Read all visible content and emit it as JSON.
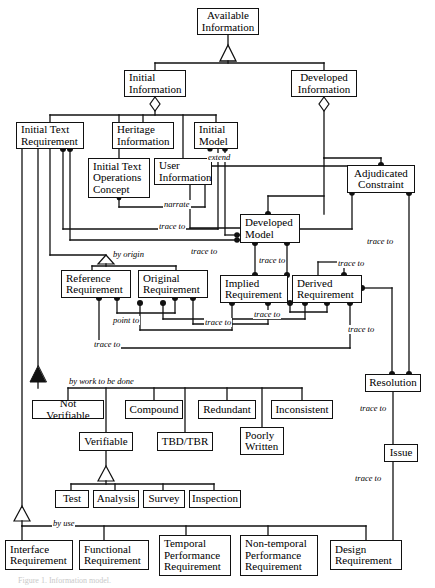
{
  "diagram": {
    "type": "uml-class-diagram",
    "colors": {
      "line": "#111111",
      "fill": "#ffffff",
      "text": "#000000"
    },
    "caption": "Figure 1. Information model.",
    "nodes": [
      {
        "id": "available-information",
        "label": "Available\nInformation",
        "x": 197,
        "y": 8,
        "w": 62,
        "h": 27,
        "align": "center"
      },
      {
        "id": "initial-information",
        "label": "Initial\nInformation",
        "x": 124,
        "y": 70,
        "w": 62,
        "h": 27,
        "align": "left"
      },
      {
        "id": "developed-information",
        "label": "Developed\nInformation",
        "x": 291,
        "y": 70,
        "w": 66,
        "h": 27,
        "align": "center"
      },
      {
        "id": "initial-text-requirement",
        "label": "Initial Text\nRequirement",
        "x": 16,
        "y": 122,
        "w": 68,
        "h": 27,
        "align": "left"
      },
      {
        "id": "heritage-information",
        "label": "Heritage\nInformation",
        "x": 112,
        "y": 122,
        "w": 62,
        "h": 27,
        "align": "left"
      },
      {
        "id": "initial-model",
        "label": "Initial\nModel",
        "x": 194,
        "y": 122,
        "w": 44,
        "h": 27,
        "align": "left"
      },
      {
        "id": "initial-text-ops-concept",
        "label": "Initial Text\nOperations\nConcept",
        "x": 88,
        "y": 158,
        "w": 62,
        "h": 40,
        "align": "left"
      },
      {
        "id": "user-information",
        "label": "User\nInformation",
        "x": 154,
        "y": 158,
        "w": 58,
        "h": 27,
        "align": "left"
      },
      {
        "id": "developed-model",
        "label": "Developed\nModel",
        "x": 240,
        "y": 214,
        "w": 60,
        "h": 29,
        "align": "left"
      },
      {
        "id": "adjudicated-constraint",
        "label": "Adjudicated\nConstraint",
        "x": 347,
        "y": 165,
        "w": 68,
        "h": 28,
        "align": "center"
      },
      {
        "id": "reference-requirement",
        "label": "Reference\nRequirement",
        "x": 61,
        "y": 270,
        "w": 70,
        "h": 28,
        "align": "left"
      },
      {
        "id": "original-requirement",
        "label": "Original\nRequirement",
        "x": 138,
        "y": 270,
        "w": 70,
        "h": 28,
        "align": "left"
      },
      {
        "id": "implied-requirement",
        "label": "Implied\nRequirement",
        "x": 220,
        "y": 275,
        "w": 68,
        "h": 28,
        "align": "left"
      },
      {
        "id": "derived-requirement",
        "label": "Derived\nRequirement",
        "x": 292,
        "y": 275,
        "w": 70,
        "h": 28,
        "align": "left"
      },
      {
        "id": "resolution",
        "label": "Resolution",
        "x": 365,
        "y": 374,
        "w": 56,
        "h": 18,
        "align": "center"
      },
      {
        "id": "issue",
        "label": "Issue",
        "x": 384,
        "y": 444,
        "w": 34,
        "h": 18,
        "align": "center"
      },
      {
        "id": "not-verifiable",
        "label": "Not Verifiable",
        "x": 32,
        "y": 400,
        "w": 72,
        "h": 19,
        "align": "center"
      },
      {
        "id": "compound",
        "label": "Compound",
        "x": 125,
        "y": 400,
        "w": 58,
        "h": 19,
        "align": "center"
      },
      {
        "id": "redundant",
        "label": "Redundant",
        "x": 198,
        "y": 400,
        "w": 58,
        "h": 19,
        "align": "center"
      },
      {
        "id": "inconsistent",
        "label": "Inconsistent",
        "x": 271,
        "y": 400,
        "w": 62,
        "h": 19,
        "align": "center"
      },
      {
        "id": "verifiable",
        "label": "Verifiable",
        "x": 79,
        "y": 432,
        "w": 54,
        "h": 19,
        "align": "center"
      },
      {
        "id": "tbd-tbr",
        "label": "TBD/TBR",
        "x": 157,
        "y": 432,
        "w": 56,
        "h": 19,
        "align": "center"
      },
      {
        "id": "poorly-written",
        "label": "Poorly\nWritten",
        "x": 240,
        "y": 427,
        "w": 44,
        "h": 28,
        "align": "left"
      },
      {
        "id": "test",
        "label": "Test",
        "x": 55,
        "y": 490,
        "w": 34,
        "h": 18,
        "align": "center"
      },
      {
        "id": "analysis",
        "label": "Analysis",
        "x": 93,
        "y": 490,
        "w": 46,
        "h": 18,
        "align": "center"
      },
      {
        "id": "survey",
        "label": "Survey",
        "x": 143,
        "y": 490,
        "w": 42,
        "h": 18,
        "align": "center"
      },
      {
        "id": "inspection",
        "label": "Inspection",
        "x": 189,
        "y": 490,
        "w": 52,
        "h": 18,
        "align": "center"
      },
      {
        "id": "interface-requirement",
        "label": "Interface\nRequirement",
        "x": 5,
        "y": 540,
        "w": 68,
        "h": 30,
        "align": "left"
      },
      {
        "id": "functional-requirement",
        "label": "Functional\nRequirement",
        "x": 79,
        "y": 540,
        "w": 70,
        "h": 30,
        "align": "left"
      },
      {
        "id": "temporal-performance-requirement",
        "label": "Temporal\nPerformance\nRequirement",
        "x": 159,
        "y": 535,
        "w": 72,
        "h": 41,
        "align": "left"
      },
      {
        "id": "non-temporal-performance-requirement",
        "label": "Non-temporal\nPerformance\nRequirement",
        "x": 240,
        "y": 535,
        "w": 78,
        "h": 41,
        "align": "left"
      },
      {
        "id": "design-requirement",
        "label": "Design\nRequirement",
        "x": 330,
        "y": 540,
        "w": 72,
        "h": 30,
        "align": "left"
      }
    ],
    "edge_labels": [
      {
        "id": "extend-label",
        "text": "extend",
        "x": 207,
        "y": 153
      },
      {
        "id": "narrate-label",
        "text": "narrate",
        "x": 163,
        "y": 200
      },
      {
        "id": "trace-to-itoc",
        "text": "trace to",
        "x": 158,
        "y": 222
      },
      {
        "id": "by-origin-label",
        "text": "by origin",
        "x": 112,
        "y": 250
      },
      {
        "id": "trace-to-devmodel-in",
        "text": "trace to",
        "x": 190,
        "y": 247
      },
      {
        "id": "trace-to-adj",
        "text": "trace to",
        "x": 366,
        "y": 237
      },
      {
        "id": "trace-to-dm-impl",
        "text": "trace to",
        "x": 258,
        "y": 256
      },
      {
        "id": "trace-to-dm-der",
        "text": "trace to",
        "x": 337,
        "y": 259
      },
      {
        "id": "point-to-label",
        "text": "point to",
        "x": 112,
        "y": 316
      },
      {
        "id": "trace-to-orig",
        "text": "trace to",
        "x": 204,
        "y": 318
      },
      {
        "id": "trace-to-impl",
        "text": "trace to",
        "x": 253,
        "y": 310
      },
      {
        "id": "trace-to-ref",
        "text": "trace to",
        "x": 93,
        "y": 340
      },
      {
        "id": "trace-to-der-res",
        "text": "trace to",
        "x": 347,
        "y": 325
      },
      {
        "id": "by-work-label",
        "text": "by work to be done",
        "x": 68,
        "y": 377
      },
      {
        "id": "trace-to-res-issue",
        "text": "trace to",
        "x": 359,
        "y": 404
      },
      {
        "id": "trace-to-issue-des",
        "text": "trace to",
        "x": 354,
        "y": 474
      },
      {
        "id": "by-use-label",
        "text": "by use",
        "x": 52,
        "y": 519
      }
    ]
  }
}
